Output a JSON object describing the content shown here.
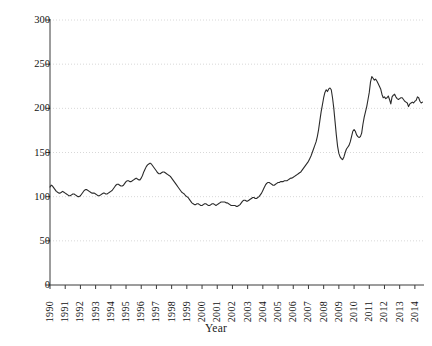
{
  "chart_data": {
    "type": "line",
    "title": "",
    "xlabel": "Year",
    "ylabel": "FAO food price index",
    "xlim": [
      1990,
      2014.6
    ],
    "ylim": [
      0,
      300
    ],
    "ytick_labels": [
      "0",
      "50",
      "100",
      "150",
      "200",
      "250",
      "300"
    ],
    "ytick_values": [
      0,
      50,
      100,
      150,
      200,
      250,
      300
    ],
    "xtick_labels": [
      "1990",
      "1991",
      "1992",
      "1993",
      "1994",
      "1995",
      "1996",
      "1997",
      "1998",
      "1999",
      "2000",
      "2001",
      "2002",
      "2003",
      "2004",
      "2005",
      "2006",
      "2007",
      "2008",
      "2009",
      "2010",
      "2011",
      "2012",
      "2013",
      "2014"
    ],
    "xtick_values": [
      1990,
      1991,
      1992,
      1993,
      1994,
      1995,
      1996,
      1997,
      1998,
      1999,
      2000,
      2001,
      2002,
      2003,
      2004,
      2005,
      2006,
      2007,
      2008,
      2009,
      2010,
      2011,
      2012,
      2013,
      2014
    ],
    "grid": "horizontal-dotted",
    "grid_color": "#d8d8d8",
    "line_color": "#2b2b2b",
    "line_width": 1.1,
    "legend": null,
    "series": [
      {
        "name": "FAO food price index",
        "x": [
          1990.0,
          1990.083,
          1990.167,
          1990.25,
          1990.333,
          1990.417,
          1990.5,
          1990.583,
          1990.667,
          1990.75,
          1990.833,
          1990.917,
          1991.0,
          1991.083,
          1991.167,
          1991.25,
          1991.333,
          1991.417,
          1991.5,
          1991.583,
          1991.667,
          1991.75,
          1991.833,
          1991.917,
          1992.0,
          1992.083,
          1992.167,
          1992.25,
          1992.333,
          1992.417,
          1992.5,
          1992.583,
          1992.667,
          1992.75,
          1992.833,
          1992.917,
          1993.0,
          1993.083,
          1993.167,
          1993.25,
          1993.333,
          1993.417,
          1993.5,
          1993.583,
          1993.667,
          1993.75,
          1993.833,
          1993.917,
          1994.0,
          1994.083,
          1994.167,
          1994.25,
          1994.333,
          1994.417,
          1994.5,
          1994.583,
          1994.667,
          1994.75,
          1994.833,
          1994.917,
          1995.0,
          1995.083,
          1995.167,
          1995.25,
          1995.333,
          1995.417,
          1995.5,
          1995.583,
          1995.667,
          1995.75,
          1995.833,
          1995.917,
          1996.0,
          1996.083,
          1996.167,
          1996.25,
          1996.333,
          1996.417,
          1996.5,
          1996.583,
          1996.667,
          1996.75,
          1996.833,
          1996.917,
          1997.0,
          1997.083,
          1997.167,
          1997.25,
          1997.333,
          1997.417,
          1997.5,
          1997.583,
          1997.667,
          1997.75,
          1997.833,
          1997.917,
          1998.0,
          1998.083,
          1998.167,
          1998.25,
          1998.333,
          1998.417,
          1998.5,
          1998.583,
          1998.667,
          1998.75,
          1998.833,
          1998.917,
          1999.0,
          1999.083,
          1999.167,
          1999.25,
          1999.333,
          1999.417,
          1999.5,
          1999.583,
          1999.667,
          1999.75,
          1999.833,
          1999.917,
          2000.0,
          2000.083,
          2000.167,
          2000.25,
          2000.333,
          2000.417,
          2000.5,
          2000.583,
          2000.667,
          2000.75,
          2000.833,
          2000.917,
          2001.0,
          2001.083,
          2001.167,
          2001.25,
          2001.333,
          2001.417,
          2001.5,
          2001.583,
          2001.667,
          2001.75,
          2001.833,
          2001.917,
          2002.0,
          2002.083,
          2002.167,
          2002.25,
          2002.333,
          2002.417,
          2002.5,
          2002.583,
          2002.667,
          2002.75,
          2002.833,
          2002.917,
          2003.0,
          2003.083,
          2003.167,
          2003.25,
          2003.333,
          2003.417,
          2003.5,
          2003.583,
          2003.667,
          2003.75,
          2003.833,
          2003.917,
          2004.0,
          2004.083,
          2004.167,
          2004.25,
          2004.333,
          2004.417,
          2004.5,
          2004.583,
          2004.667,
          2004.75,
          2004.833,
          2004.917,
          2005.0,
          2005.083,
          2005.167,
          2005.25,
          2005.333,
          2005.417,
          2005.5,
          2005.583,
          2005.667,
          2005.75,
          2005.833,
          2005.917,
          2006.0,
          2006.083,
          2006.167,
          2006.25,
          2006.333,
          2006.417,
          2006.5,
          2006.583,
          2006.667,
          2006.75,
          2006.833,
          2006.917,
          2007.0,
          2007.083,
          2007.167,
          2007.25,
          2007.333,
          2007.417,
          2007.5,
          2007.583,
          2007.667,
          2007.75,
          2007.833,
          2007.917,
          2008.0,
          2008.083,
          2008.167,
          2008.25,
          2008.333,
          2008.417,
          2008.5,
          2008.583,
          2008.667,
          2008.75,
          2008.833,
          2008.917,
          2009.0,
          2009.083,
          2009.167,
          2009.25,
          2009.333,
          2009.417,
          2009.5,
          2009.583,
          2009.667,
          2009.75,
          2009.833,
          2009.917,
          2010.0,
          2010.083,
          2010.167,
          2010.25,
          2010.333,
          2010.417,
          2010.5,
          2010.583,
          2010.667,
          2010.75,
          2010.833,
          2010.917,
          2011.0,
          2011.083,
          2011.167,
          2011.25,
          2011.333,
          2011.417,
          2011.5,
          2011.583,
          2011.667,
          2011.75,
          2011.833,
          2011.917,
          2012.0,
          2012.083,
          2012.167,
          2012.25,
          2012.333,
          2012.417,
          2012.5,
          2012.583,
          2012.667,
          2012.75,
          2012.833,
          2012.917,
          2013.0,
          2013.083,
          2013.167,
          2013.25,
          2013.333,
          2013.417,
          2013.5,
          2013.583,
          2013.667,
          2013.75,
          2013.833,
          2013.917,
          2014.0,
          2014.083,
          2014.167,
          2014.25,
          2014.333,
          2014.417,
          2014.5
        ],
        "values": [
          111,
          113,
          112,
          110,
          108,
          106,
          105,
          104,
          104,
          105,
          106,
          105,
          104,
          103,
          102,
          101,
          101,
          102,
          103,
          103,
          102,
          101,
          100,
          100,
          101,
          103,
          105,
          107,
          108,
          108,
          107,
          106,
          105,
          104,
          104,
          104,
          103,
          102,
          101,
          101,
          102,
          103,
          104,
          104,
          103,
          103,
          104,
          105,
          106,
          107,
          109,
          111,
          113,
          114,
          114,
          113,
          112,
          112,
          113,
          115,
          117,
          118,
          118,
          117,
          117,
          118,
          119,
          120,
          121,
          120,
          119,
          119,
          121,
          124,
          128,
          131,
          134,
          136,
          137,
          138,
          137,
          135,
          133,
          131,
          129,
          127,
          126,
          126,
          127,
          128,
          128,
          127,
          126,
          125,
          124,
          123,
          121,
          119,
          117,
          115,
          113,
          111,
          109,
          107,
          105,
          104,
          103,
          101,
          100,
          99,
          97,
          95,
          93,
          92,
          91,
          91,
          92,
          92,
          91,
          90,
          90,
          91,
          92,
          92,
          91,
          90,
          90,
          91,
          92,
          92,
          91,
          90,
          91,
          92,
          93,
          94,
          94,
          94,
          94,
          93,
          93,
          92,
          91,
          90,
          90,
          90,
          90,
          89,
          89,
          90,
          91,
          93,
          95,
          96,
          96,
          95,
          95,
          96,
          97,
          98,
          99,
          99,
          98,
          98,
          99,
          100,
          102,
          104,
          107,
          110,
          113,
          115,
          116,
          116,
          115,
          114,
          113,
          113,
          114,
          115,
          116,
          116,
          117,
          117,
          117,
          118,
          118,
          118,
          119,
          120,
          121,
          121,
          122,
          123,
          124,
          125,
          126,
          127,
          128,
          130,
          132,
          134,
          136,
          138,
          140,
          143,
          146,
          150,
          154,
          158,
          162,
          168,
          176,
          186,
          196,
          204,
          212,
          218,
          221,
          219,
          222,
          223,
          221,
          212,
          200,
          185,
          170,
          157,
          149,
          145,
          143,
          142,
          145,
          150,
          154,
          156,
          158,
          162,
          168,
          174,
          176,
          174,
          170,
          168,
          167,
          168,
          172,
          182,
          190,
          196,
          202,
          210,
          218,
          230,
          236,
          234,
          232,
          233,
          231,
          228,
          225,
          222,
          216,
          212,
          213,
          211,
          212,
          214,
          210,
          205,
          213,
          215,
          216,
          213,
          211,
          210,
          211,
          212,
          212,
          210,
          208,
          207,
          206,
          202,
          205,
          206,
          207,
          206,
          208,
          209,
          213,
          212,
          208,
          206,
          207
        ]
      }
    ]
  },
  "axis": {
    "y_title": "FAO food price index",
    "x_title": "Year"
  }
}
